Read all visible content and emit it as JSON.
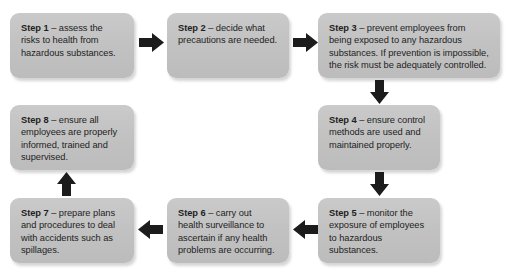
{
  "diagram": {
    "type": "flowchart",
    "box_fill_color": "#c3c3c3",
    "arrow_color": "#1c1c1c",
    "background_color": "#ffffff",
    "steps": [
      {
        "id": "step-1",
        "lead": "Step 1",
        "separator": " – ",
        "text": "assess the risks to health from hazardous substances."
      },
      {
        "id": "step-2",
        "lead": "Step 2",
        "separator": " – ",
        "text": "decide what precautions are needed."
      },
      {
        "id": "step-3",
        "lead": "Step 3",
        "separator": " – ",
        "text": "prevent employees from being exposed to any hazardous substances. If prevention is impossible, the risk must be adequately controlled."
      },
      {
        "id": "step-4",
        "lead": "Step 4",
        "separator": " – ",
        "text": "ensure control methods are used and maintained properly."
      },
      {
        "id": "step-5",
        "lead": "Step 5",
        "separator": " – ",
        "text": "monitor the exposure of employees to hazardous substances."
      },
      {
        "id": "step-6",
        "lead": "Step 6",
        "separator": " – ",
        "text": "carry out health surveillance to ascertain if any health problems are occurring."
      },
      {
        "id": "step-7",
        "lead": "Step 7",
        "separator": " – ",
        "text": "prepare plans and procedures to deal with accidents such as spillages."
      },
      {
        "id": "step-8",
        "lead": "Step 8",
        "separator": " – ",
        "text": "ensure all employees are properly informed, trained and supervised."
      }
    ],
    "connectors": [
      {
        "id": "arrow-step1-step2",
        "direction": "right"
      },
      {
        "id": "arrow-step2-step3",
        "direction": "right"
      },
      {
        "id": "arrow-step3-step4",
        "direction": "down"
      },
      {
        "id": "arrow-step4-step5",
        "direction": "down"
      },
      {
        "id": "arrow-step5-step6",
        "direction": "left"
      },
      {
        "id": "arrow-step6-step7",
        "direction": "left"
      },
      {
        "id": "arrow-step7-step8",
        "direction": "up"
      }
    ]
  }
}
